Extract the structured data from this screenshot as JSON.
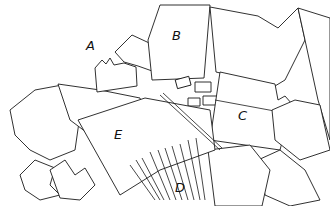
{
  "figure": {
    "labels": [
      {
        "id": "A",
        "text": "A",
        "x": 86,
        "y": 38
      },
      {
        "id": "B",
        "text": "B",
        "x": 172,
        "y": 28
      },
      {
        "id": "C",
        "text": "C",
        "x": 238,
        "y": 108
      },
      {
        "id": "D",
        "text": "D",
        "x": 175,
        "y": 180
      },
      {
        "id": "E",
        "text": "E",
        "x": 114,
        "y": 127
      }
    ],
    "colors": {
      "line": "#1a1a1a",
      "background": "#ffffff"
    }
  }
}
